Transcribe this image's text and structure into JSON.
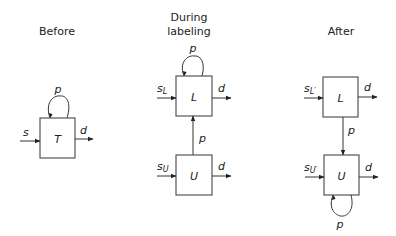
{
  "panels": [
    {
      "title": [
        "Before"
      ],
      "boxes": [
        {
          "label": "T"
        }
      ],
      "inputs": [
        {
          "label": "s",
          "sub": ""
        }
      ],
      "outputs": [
        {
          "label": "d"
        }
      ],
      "loops": [
        {
          "label": "p",
          "position": "top"
        }
      ]
    },
    {
      "title": [
        "During",
        "labeling"
      ],
      "boxes": [
        {
          "label": "L"
        },
        {
          "label": "U"
        }
      ],
      "inputs": [
        {
          "label": "s",
          "sub": "L"
        },
        {
          "label": "s",
          "sub": "U"
        }
      ],
      "outputs": [
        {
          "label": "d"
        },
        {
          "label": "d"
        }
      ],
      "loops": [
        {
          "label": "p",
          "position": "top of L"
        }
      ],
      "links": [
        {
          "from": "U",
          "to": "L",
          "label": "p"
        }
      ]
    },
    {
      "title": [
        "After"
      ],
      "boxes": [
        {
          "label": "L"
        },
        {
          "label": "U"
        }
      ],
      "inputs": [
        {
          "label": "s",
          "sub": "L′"
        },
        {
          "label": "s",
          "sub": "U′"
        }
      ],
      "outputs": [
        {
          "label": "d"
        },
        {
          "label": "d"
        }
      ],
      "loops": [
        {
          "label": "p",
          "position": "bottom of U"
        }
      ],
      "links": [
        {
          "from": "L",
          "to": "U",
          "label": "p"
        }
      ]
    }
  ]
}
